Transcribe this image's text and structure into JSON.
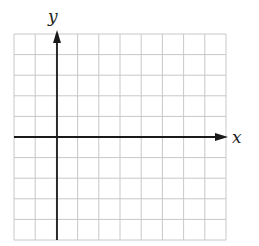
{
  "diagram": {
    "type": "coordinate-grid",
    "x_axis_label": "x",
    "y_axis_label": "y",
    "grid": {
      "columns": 10,
      "rows": 10,
      "left": 14,
      "top": 34,
      "cell_width": 21.2,
      "cell_height": 20.6,
      "line_color": "#c8c8c8"
    },
    "axes": {
      "origin_px": [
        57,
        137
      ],
      "axis_color": "#1a1a1a",
      "x_axis": {
        "start": 14,
        "end": 228
      },
      "y_axis": {
        "start": 240,
        "end": 30
      }
    }
  }
}
